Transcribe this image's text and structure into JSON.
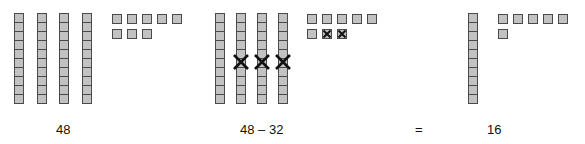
{
  "diagram": {
    "colors": {
      "block_fill": "#c2c2c2",
      "block_border": "#4a4a4a",
      "cross": "#111111"
    },
    "panels": [
      {
        "id": "minuend",
        "tens": 4,
        "ones": 8,
        "crossed_tens": 0,
        "crossed_ones": 0,
        "label": "48"
      },
      {
        "id": "subtraction",
        "tens": 4,
        "ones": 8,
        "crossed_tens": 3,
        "crossed_ones": 2,
        "label": "48 – 32"
      },
      {
        "id": "result",
        "tens": 1,
        "ones": 6,
        "crossed_tens": 0,
        "crossed_ones": 0,
        "label": "16"
      }
    ],
    "equals_label": "="
  }
}
